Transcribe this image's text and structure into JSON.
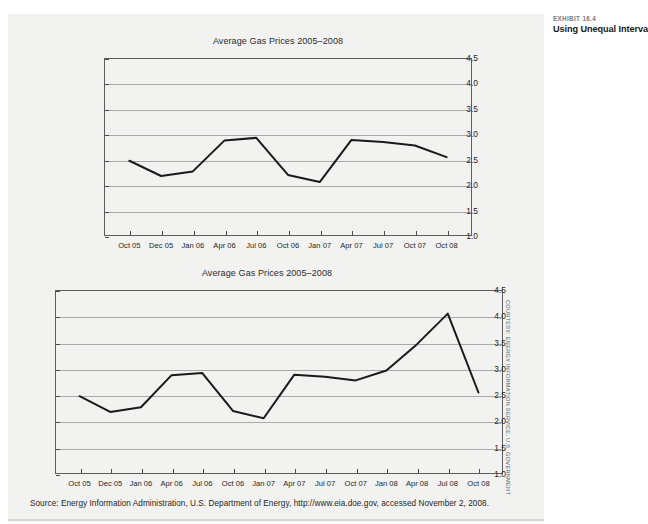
{
  "exhibit": {
    "kicker": "EXHIBIT 16.4",
    "title": "Using Unequal Intervals"
  },
  "source_note": "Source: Energy Information Administration, U.S. Department of Energy, http://www.eia.doe.gov, accessed November 2, 2008.",
  "credit": "COURTESY: ENERGY INFORMATION SERVICE, U.S. GOVERNMENT",
  "chart_data": [
    {
      "id": "chart-unequal-intervals",
      "type": "line",
      "title": "Average Gas Prices 2005–2008",
      "xlabel": "",
      "ylabel": "",
      "ylim": [
        1.0,
        4.5
      ],
      "yticks": [
        "1.0",
        "1.5",
        "2.0",
        "2.5",
        "3.0",
        "3.5",
        "4.0",
        "4.5"
      ],
      "ytick_values": [
        1.0,
        1.5,
        2.0,
        2.5,
        3.0,
        3.5,
        4.0,
        4.5
      ],
      "grid": true,
      "legend": "none",
      "categories": [
        "Oct 05",
        "Dec 05",
        "Jan 06",
        "Apr 06",
        "Jul 06",
        "Oct 06",
        "Jan 07",
        "Apr 07",
        "Jul 07",
        "Oct 07",
        "Oct 08"
      ],
      "values": [
        2.48,
        2.18,
        2.27,
        2.88,
        2.93,
        2.2,
        2.06,
        2.89,
        2.85,
        2.78,
        2.55
      ],
      "note": "Unequal spacing: final interval jumps from Oct 07 to Oct 08 while all other points are spaced by quarter."
    },
    {
      "id": "chart-equal-intervals",
      "type": "line",
      "title": "Average Gas Prices 2005–2008",
      "xlabel": "",
      "ylabel": "",
      "ylim": [
        1.0,
        4.5
      ],
      "yticks": [
        "1.0",
        "1.5",
        "2.0",
        "2.5",
        "3.0",
        "3.5",
        "4.0",
        "4.5"
      ],
      "ytick_values": [
        1.0,
        1.5,
        2.0,
        2.5,
        3.0,
        3.5,
        4.0,
        4.5
      ],
      "grid": true,
      "legend": "none",
      "categories": [
        "Oct 05",
        "Dec 05",
        "Jan 06",
        "Apr 06",
        "Jul 06",
        "Oct 06",
        "Jan 07",
        "Apr 07",
        "Jul 07",
        "Oct 07",
        "Jan 08",
        "Apr 08",
        "Jul 08",
        "Oct 08"
      ],
      "values": [
        2.48,
        2.18,
        2.27,
        2.88,
        2.92,
        2.2,
        2.06,
        2.89,
        2.85,
        2.78,
        2.97,
        3.47,
        4.05,
        2.55
      ],
      "note": "Equal spacing across all quarters reveals the Jul 08 peak and subsequent drop."
    }
  ]
}
